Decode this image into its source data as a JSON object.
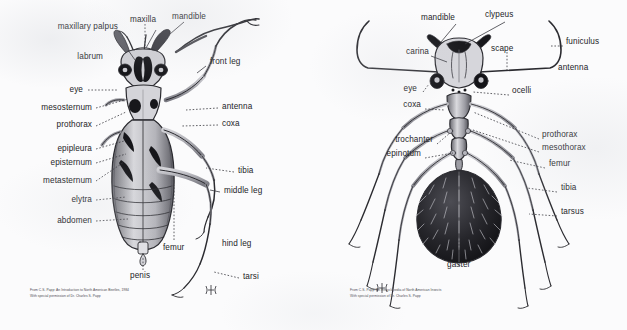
{
  "document": {
    "kind": "scanned-figure-plate",
    "panels": 2,
    "background_color": "#fbfbfc",
    "ink_color": "#242428"
  },
  "beetle": {
    "title": "Beetle external anatomy (ventral/dorsal view)",
    "signature": "monogram-papp",
    "credit_line_1": "From C.S. Papp: An Introduction to North American Beetles, 1984",
    "credit_line_2": "With special permission of Dr. Charles S. Papp",
    "labels_left": [
      {
        "text": "maxillary palpus",
        "x": 118,
        "y": 27
      },
      {
        "text": "labrum",
        "x": 103,
        "y": 57
      },
      {
        "text": "eye",
        "x": 83,
        "y": 90
      },
      {
        "text": "mesosternum",
        "x": 92,
        "y": 108
      },
      {
        "text": "prothorax",
        "x": 92,
        "y": 125
      },
      {
        "text": "epipleura",
        "x": 92,
        "y": 148
      },
      {
        "text": "episternum",
        "x": 92,
        "y": 162
      },
      {
        "text": "metasternum",
        "x": 92,
        "y": 180
      },
      {
        "text": "elytra",
        "x": 92,
        "y": 199
      },
      {
        "text": "abdomen",
        "x": 92,
        "y": 220
      }
    ],
    "labels_top": [
      {
        "text": "maxilla",
        "x": 143,
        "y": 20
      },
      {
        "text": "mandible",
        "x": 186,
        "y": 17
      }
    ],
    "labels_right": [
      {
        "text": "front leg",
        "x": 210,
        "y": 62
      },
      {
        "text": "antenna",
        "x": 222,
        "y": 107
      },
      {
        "text": "coxa",
        "x": 222,
        "y": 124
      },
      {
        "text": "tibia",
        "x": 238,
        "y": 171
      },
      {
        "text": "middle leg",
        "x": 224,
        "y": 191
      },
      {
        "text": "hind leg",
        "x": 222,
        "y": 244
      },
      {
        "text": "tarsi",
        "x": 243,
        "y": 277
      }
    ],
    "labels_bottom": [
      {
        "text": "femur",
        "x": 175,
        "y": 248
      },
      {
        "text": "penis",
        "x": 134,
        "y": 276
      }
    ]
  },
  "ant": {
    "title": "Ant external anatomy (dorsal view)",
    "signature": "monogram-papp",
    "credit_line_1": "From C.S. Papp: An Encyclopedia of North American Insects",
    "credit_line_2": "With special permission of Dr. Charles S. Papp",
    "labels_top": [
      {
        "text": "mandible",
        "x": 440,
        "y": 18
      },
      {
        "text": "clypeus",
        "x": 500,
        "y": 15
      }
    ],
    "labels_left": [
      {
        "text": "carina",
        "x": 424,
        "y": 52
      },
      {
        "text": "eye",
        "x": 416,
        "y": 89
      },
      {
        "text": "coxa",
        "x": 422,
        "y": 105
      },
      {
        "text": "trochanter",
        "x": 430,
        "y": 140
      },
      {
        "text": "epinotum",
        "x": 420,
        "y": 154
      }
    ],
    "labels_inner": [
      {
        "text": "scape",
        "x": 507,
        "y": 49
      }
    ],
    "labels_right": [
      {
        "text": "funiculus",
        "x": 558,
        "y": 42
      },
      {
        "text": "antenna",
        "x": 558,
        "y": 68
      },
      {
        "text": "ocelli",
        "x": 507,
        "y": 91
      },
      {
        "text": "prothorax",
        "x": 540,
        "y": 135
      },
      {
        "text": "mesothorax",
        "x": 540,
        "y": 148
      },
      {
        "text": "femur",
        "x": 547,
        "y": 164
      },
      {
        "text": "tibia",
        "x": 558,
        "y": 188
      },
      {
        "text": "tarsus",
        "x": 558,
        "y": 212
      }
    ],
    "labels_bottom": [
      {
        "text": "gaster",
        "x": 463,
        "y": 265
      }
    ]
  }
}
